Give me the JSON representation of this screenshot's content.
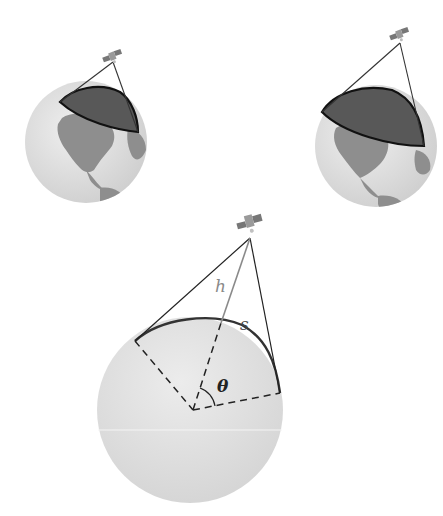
{
  "figure": {
    "labels": {
      "height": "h",
      "arc": "s",
      "angle": "θ"
    },
    "panels": [
      {
        "name": "globe-small-coverage",
        "position": "top-left"
      },
      {
        "name": "globe-large-coverage",
        "position": "top-right"
      },
      {
        "name": "cross-section",
        "position": "bottom-center"
      }
    ],
    "colors": {
      "globe_ocean": "#dcdcdc",
      "globe_land": "#8c8c8c",
      "coverage_cap": "#5a5a5a",
      "cross_section_fill": "#e2e2e2",
      "line": "#222222",
      "h_line": "#8a8a8a"
    }
  }
}
